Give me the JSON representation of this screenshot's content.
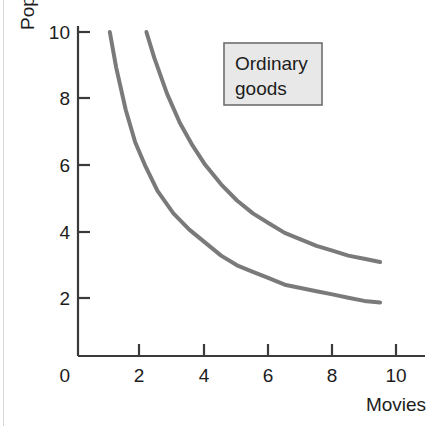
{
  "chart_data": {
    "type": "line",
    "title": "",
    "subtitle": "",
    "xlabel": "Movies",
    "ylabel": "Pop (cans)",
    "xlim": [
      0,
      10.6
    ],
    "ylim": [
      0,
      10.6
    ],
    "xticks": [
      "2",
      "4",
      "6",
      "8",
      "10"
    ],
    "xtick_values": [
      2,
      4,
      6,
      8,
      10
    ],
    "yticks": [
      "2",
      "4",
      "6",
      "8",
      "10"
    ],
    "ytick_values": [
      2,
      4,
      6,
      8,
      10
    ],
    "origin_label": "0",
    "grid": false,
    "legend_position": "upper-right-inside",
    "annotations": [
      {
        "name": "ordinary-goods-box",
        "line1": "Ordinary",
        "line2": "goods"
      }
    ],
    "series": [
      {
        "name": "lower-indifference-curve",
        "color": "#7a7a7a",
        "linewidth": 4,
        "x": [
          1.0,
          1.2,
          1.5,
          1.8,
          2.1,
          2.5,
          3.0,
          3.5,
          4.0,
          4.5,
          5.0,
          5.5,
          6.0,
          6.5,
          7.0,
          7.5,
          8.0,
          8.5,
          9.0,
          9.5
        ],
        "y": [
          10.0,
          8.9,
          7.6,
          6.6,
          5.9,
          5.1,
          4.4,
          3.9,
          3.5,
          3.1,
          2.8,
          2.6,
          2.4,
          2.2,
          2.1,
          2.0,
          1.9,
          1.8,
          1.7,
          1.65
        ]
      },
      {
        "name": "upper-indifference-curve",
        "color": "#7a7a7a",
        "linewidth": 4,
        "x": [
          2.15,
          2.4,
          2.8,
          3.2,
          3.6,
          4.0,
          4.5,
          5.0,
          5.5,
          6.0,
          6.5,
          7.0,
          7.5,
          8.0,
          8.5,
          9.0,
          9.5
        ],
        "y": [
          10.0,
          9.2,
          8.1,
          7.2,
          6.5,
          5.9,
          5.3,
          4.8,
          4.4,
          4.1,
          3.8,
          3.6,
          3.4,
          3.25,
          3.1,
          3.0,
          2.9
        ]
      }
    ],
    "colors": {
      "curve": "#7a7a7a",
      "axis": "#3a3a3a",
      "text": "#1c1c1c",
      "legend_fill": "#e8e8e8",
      "legend_border": "#6e6e6e",
      "background": "#ffffff"
    }
  }
}
